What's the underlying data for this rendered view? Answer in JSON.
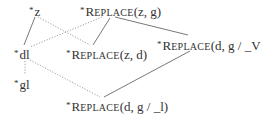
{
  "diagram": {
    "nodes": {
      "z": {
        "star": "*",
        "label": "z"
      },
      "replace_zg": {
        "star": "*",
        "fn_first": "R",
        "fn_rest": "EPLACE",
        "args": "(z, g)"
      },
      "dl": {
        "star": "*",
        "label": "dl"
      },
      "replace_zd": {
        "star": "*",
        "fn_first": "R",
        "fn_rest": "EPLACE",
        "args": "(z, d)"
      },
      "replace_dg_v": {
        "star": "*",
        "fn_first": "R",
        "fn_rest": "EPLACE",
        "args": "(d, g  /  _V"
      },
      "gl": {
        "star": "*",
        "label": "gl"
      },
      "replace_dg_l": {
        "star": "*",
        "fn_first": "R",
        "fn_rest": "EPLACE",
        "args": "(d, g  /  _l)"
      }
    },
    "edges": [
      {
        "from": "z",
        "to": "dl",
        "style": "solid"
      },
      {
        "from": "z",
        "to": "replace_zd",
        "style": "dotted"
      },
      {
        "from": "replace_zg",
        "to": "dl",
        "style": "dotted"
      },
      {
        "from": "replace_zg",
        "to": "replace_zd",
        "style": "solid"
      },
      {
        "from": "replace_zg",
        "to": "replace_dg_v",
        "style": "solid"
      },
      {
        "from": "dl",
        "to": "gl",
        "style": "dotted"
      },
      {
        "from": "dl",
        "to": "replace_dg_l",
        "style": "dotted"
      },
      {
        "from": "replace_dg_v",
        "to": "replace_dg_l",
        "style": "solid"
      }
    ]
  }
}
